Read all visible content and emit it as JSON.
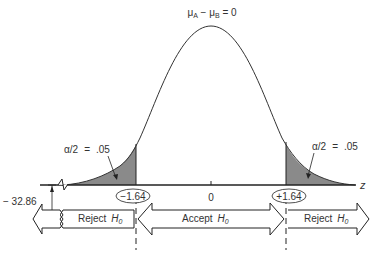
{
  "figure": {
    "title_label": "μA − μB = 0",
    "title_parts": {
      "mu_a": "μ",
      "sub_a": "A",
      "minus": " − ",
      "mu_b": "μ",
      "sub_b": "B",
      "eq": " = 0"
    },
    "axis_label": "z",
    "tick_center": "0",
    "critical_left": "−1.64",
    "critical_right": "+1.64",
    "offset_label": "− 32.86",
    "tail_left": {
      "alpha": "α/2",
      "eq": "=",
      "value": ".05"
    },
    "tail_right": {
      "alpha": "α/2",
      "eq": "=",
      "value": ".05"
    },
    "regions": [
      {
        "label": "Reject",
        "sub": "H",
        "subscript": "0",
        "direction": "left"
      },
      {
        "label": "Accept",
        "sub": "H",
        "subscript": "0",
        "direction": "both"
      },
      {
        "label": "Reject",
        "sub": "H",
        "subscript": "0",
        "direction": "right"
      }
    ],
    "colors": {
      "line": "#333333",
      "shade": "#8a8a8a",
      "background": "#ffffff"
    }
  }
}
